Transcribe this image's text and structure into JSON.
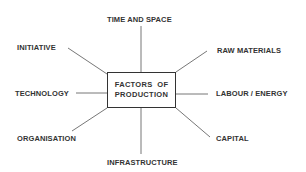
{
  "diagram": {
    "center": {
      "line1": "FACTORS  OF",
      "line2": "PRODUCTION"
    },
    "factors": [
      {
        "label": "TIME AND SPACE",
        "position": "top"
      },
      {
        "label": "RAW MATERIALS",
        "position": "top-right"
      },
      {
        "label": "LABOUR / ENERGY",
        "position": "right"
      },
      {
        "label": "CAPITAL",
        "position": "bottom-right"
      },
      {
        "label": "INFRASTRUCTURE",
        "position": "bottom"
      },
      {
        "label": "ORGANISATION",
        "position": "bottom-left"
      },
      {
        "label": "TECHNOLOGY",
        "position": "left"
      },
      {
        "label": "INITIATIVE",
        "position": "top-left"
      }
    ],
    "colors": {
      "line": "#666666",
      "text": "#333333",
      "box_border": "#333333",
      "background": "#ffffff"
    }
  }
}
